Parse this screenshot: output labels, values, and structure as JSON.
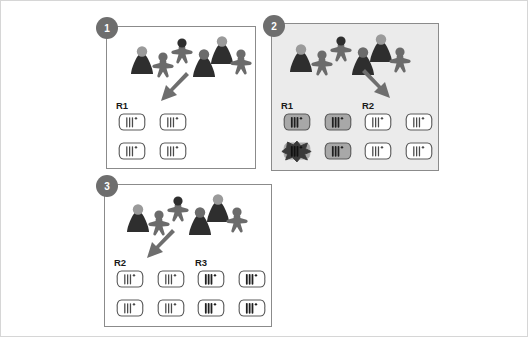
{
  "figure": {
    "background_color": "#ffffff",
    "outer_border_color": "#d6d6d6",
    "panel_border_color": "#8b8b8b",
    "badge_color": "#6e6e6e",
    "badge_text_color": "#ffffff",
    "arrow_color": "#6e6e6e",
    "host_dark_color": "#2e2e2e",
    "host_mid_color": "#6b6b6b",
    "host_light_color": "#9a9a9a",
    "cell_outline_color": "#5a5a5a",
    "cell_fill_white": "#ffffff",
    "cell_fill_gray": "#a8a8a8",
    "cell_fill_dark": "#3a3a3a",
    "panel2_background": "#ebebeb"
  },
  "panels": [
    {
      "id": "panel-1",
      "number": "1",
      "shaded": false,
      "arrow_direction": "down-left",
      "hosts": [
        {
          "shape": "cone",
          "body": "dark",
          "head": "light"
        },
        {
          "shape": "person",
          "body": "mid",
          "head": "mid"
        },
        {
          "shape": "person",
          "body": "mid",
          "head": "dark"
        },
        {
          "shape": "cone",
          "body": "dark",
          "head": "mid"
        },
        {
          "shape": "cone",
          "body": "dark",
          "head": "light"
        },
        {
          "shape": "person",
          "body": "mid",
          "head": "mid"
        }
      ],
      "groups": [
        {
          "label": "R1",
          "cells": [
            {
              "fill": "white",
              "stripes": "light",
              "state": "intact"
            },
            {
              "fill": "white",
              "stripes": "light",
              "state": "intact"
            },
            {
              "fill": "white",
              "stripes": "light",
              "state": "intact"
            },
            {
              "fill": "white",
              "stripes": "light",
              "state": "intact"
            }
          ]
        }
      ]
    },
    {
      "id": "panel-2",
      "number": "2",
      "shaded": true,
      "arrow_direction": "down-right",
      "hosts": [
        {
          "shape": "cone",
          "body": "dark",
          "head": "light"
        },
        {
          "shape": "person",
          "body": "mid",
          "head": "mid"
        },
        {
          "shape": "person",
          "body": "mid",
          "head": "dark"
        },
        {
          "shape": "cone",
          "body": "dark",
          "head": "mid"
        },
        {
          "shape": "cone",
          "body": "dark",
          "head": "light"
        },
        {
          "shape": "person",
          "body": "mid",
          "head": "mid"
        }
      ],
      "groups": [
        {
          "label": "R1",
          "cells": [
            {
              "fill": "gray",
              "stripes": "dark",
              "state": "intact"
            },
            {
              "fill": "gray",
              "stripes": "dark",
              "state": "intact"
            },
            {
              "fill": "dark",
              "stripes": "dark",
              "state": "lysed"
            },
            {
              "fill": "gray",
              "stripes": "dark",
              "state": "intact"
            }
          ]
        },
        {
          "label": "R2",
          "cells": [
            {
              "fill": "white",
              "stripes": "light",
              "state": "intact"
            },
            {
              "fill": "white",
              "stripes": "light",
              "state": "intact"
            },
            {
              "fill": "white",
              "stripes": "light",
              "state": "intact"
            },
            {
              "fill": "white",
              "stripes": "light",
              "state": "intact"
            }
          ]
        }
      ]
    },
    {
      "id": "panel-3",
      "number": "3",
      "shaded": false,
      "arrow_direction": "down-left",
      "hosts": [
        {
          "shape": "cone",
          "body": "dark",
          "head": "light"
        },
        {
          "shape": "person",
          "body": "mid",
          "head": "mid"
        },
        {
          "shape": "person",
          "body": "mid",
          "head": "dark"
        },
        {
          "shape": "cone",
          "body": "dark",
          "head": "mid"
        },
        {
          "shape": "cone",
          "body": "dark",
          "head": "light"
        },
        {
          "shape": "person",
          "body": "mid",
          "head": "mid"
        }
      ],
      "groups": [
        {
          "label": "R2",
          "cells": [
            {
              "fill": "white",
              "stripes": "light",
              "state": "intact"
            },
            {
              "fill": "white",
              "stripes": "light",
              "state": "intact"
            },
            {
              "fill": "white",
              "stripes": "light",
              "state": "intact"
            },
            {
              "fill": "white",
              "stripes": "light",
              "state": "intact"
            }
          ]
        },
        {
          "label": "R3",
          "cells": [
            {
              "fill": "white",
              "stripes": "dark",
              "state": "intact"
            },
            {
              "fill": "white",
              "stripes": "dark",
              "state": "intact"
            },
            {
              "fill": "white",
              "stripes": "dark",
              "state": "intact"
            },
            {
              "fill": "white",
              "stripes": "dark",
              "state": "intact"
            }
          ]
        }
      ]
    }
  ]
}
